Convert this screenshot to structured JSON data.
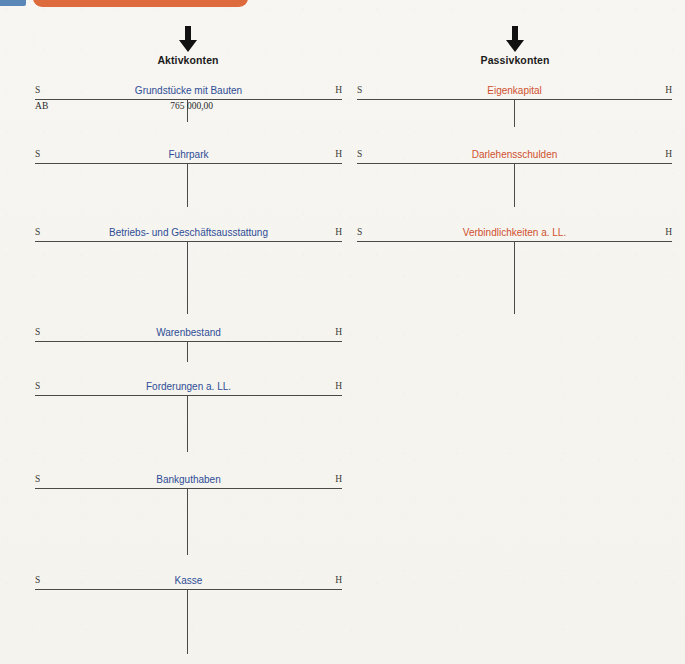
{
  "page": {
    "background_color": "#f5f4ef",
    "badge_color": "#5b86b8",
    "bar_color": "#dd6b3e",
    "asset_label_color": "#2f4d96",
    "liability_label_color": "#d0502e",
    "rule_color": "#4a4a46"
  },
  "columns": [
    {
      "id": "aktiv",
      "caption": "Aktivkonten",
      "arrow": "arrow-down-icon",
      "debit_marker": "S",
      "credit_marker": "H",
      "accounts": [
        {
          "name": "Grundstücke mit Bauten",
          "entries": [
            {
              "label": "AB",
              "amount": "765 000,00"
            }
          ]
        },
        {
          "name": "Fuhrpark",
          "entries": []
        },
        {
          "name": "Betriebs- und Geschäftsausstattung",
          "entries": []
        },
        {
          "name": "Warenbestand",
          "entries": []
        },
        {
          "name": "Forderungen a. LL.",
          "entries": []
        },
        {
          "name": "Bankguthaben",
          "entries": []
        },
        {
          "name": "Kasse",
          "entries": []
        }
      ]
    },
    {
      "id": "passiv",
      "caption": "Passivkonten",
      "arrow": "arrow-down-icon",
      "debit_marker": "S",
      "credit_marker": "H",
      "accounts": [
        {
          "name": "Eigenkapital",
          "entries": []
        },
        {
          "name": "Darlehensschulden",
          "entries": []
        },
        {
          "name": "Verbindlichkeiten a. LL.",
          "entries": []
        }
      ]
    }
  ]
}
